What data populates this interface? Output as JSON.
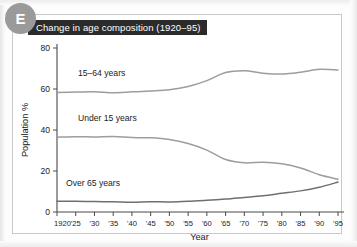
{
  "badge": {
    "label": "E"
  },
  "figure": {
    "title": "Change in age composition (1920–95)"
  },
  "colors": {
    "badge_bg": "#9a9a9a",
    "title_bg": "#2b2b2b",
    "title_fg": "#ffffff",
    "axis": "#4a4a4a",
    "series_15_64": "#9d9d9d",
    "series_under_15": "#9d9d9d",
    "series_over_65": "#6f6f6f",
    "panel_border": "#c9c9c9"
  },
  "chart_data": {
    "type": "line",
    "title": "Change in age composition (1920–95)",
    "xlabel": "Year",
    "ylabel": "Population %",
    "ylim": [
      0,
      80
    ],
    "yticks": [
      0,
      20,
      40,
      60,
      80
    ],
    "ytick_labels": [
      "0",
      "20",
      "40",
      "60",
      "80"
    ],
    "grid": false,
    "legend": "inline-labels",
    "x": [
      1920,
      1925,
      1930,
      1935,
      1940,
      1945,
      1950,
      1955,
      1960,
      1965,
      1970,
      1975,
      1980,
      1985,
      1990,
      1995
    ],
    "xtick_labels": [
      "1920",
      "'25",
      "'30",
      "'35",
      "'40",
      "'45",
      "'50",
      "'55",
      "'60",
      "'65",
      "'70",
      "'75",
      "'80",
      "'85",
      "'90",
      "'95"
    ],
    "series": [
      {
        "name": "15–64 years",
        "label": "15–64 years",
        "color": "#9d9d9d",
        "values": [
          58.3,
          58.5,
          58.7,
          58.2,
          58.6,
          59.0,
          59.6,
          61.2,
          64.1,
          68.0,
          68.9,
          67.7,
          67.3,
          68.2,
          69.6,
          69.3
        ]
      },
      {
        "name": "Under 15 years",
        "label": "Under 15 years",
        "color": "#9d9d9d",
        "values": [
          36.5,
          36.7,
          36.6,
          36.8,
          36.3,
          36.2,
          35.4,
          33.4,
          30.2,
          25.6,
          24.0,
          24.3,
          23.5,
          21.5,
          18.2,
          16.0
        ]
      },
      {
        "name": "Over 65 years",
        "label": "Over 65 years",
        "color": "#6f6f6f",
        "values": [
          5.3,
          5.2,
          5.1,
          5.0,
          4.8,
          5.0,
          4.9,
          5.3,
          5.7,
          6.3,
          7.1,
          7.9,
          9.1,
          10.3,
          12.1,
          14.6
        ]
      }
    ]
  }
}
